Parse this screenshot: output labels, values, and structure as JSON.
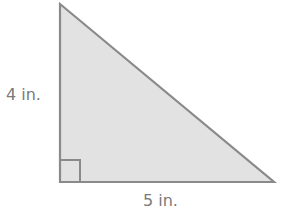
{
  "diagram": {
    "shape": "right-triangle",
    "fill_color": "#e2e2e2",
    "stroke_color": "#8a8a8a",
    "label_color": "#7a7a7a",
    "height_label": "4 in.",
    "base_label": "5 in.",
    "right_angle_marker": true
  }
}
